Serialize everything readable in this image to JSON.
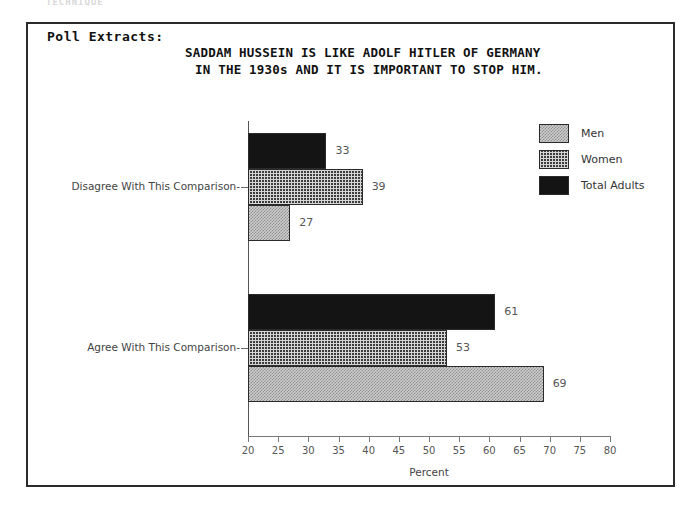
{
  "artifact_text": "TECHNIQUE",
  "header": {
    "poll_label": "Poll Extracts:"
  },
  "chart_data": {
    "type": "bar",
    "orientation": "horizontal",
    "title_line1": "SADDAM HUSSEIN IS LIKE ADOLF HITLER OF GERMANY",
    "title_line2": "IN THE 1930s AND IT IS IMPORTANT TO STOP HIM.",
    "xlabel": "Percent",
    "ylabel": "",
    "xlim": [
      20,
      80
    ],
    "xticks": [
      20,
      25,
      30,
      35,
      40,
      45,
      50,
      55,
      60,
      65,
      70,
      75,
      80
    ],
    "xticklabels": [
      "20",
      "25",
      "30",
      "35",
      "40",
      "45",
      "50",
      "55",
      "60",
      "65",
      "70",
      "75",
      "80"
    ],
    "grid": false,
    "legend_position": "top-right",
    "categories": [
      "Disagree With This Comparison",
      "Agree With This Comparison"
    ],
    "series": [
      {
        "name": "Men",
        "values": [
          27,
          69
        ],
        "pattern": "light-checker",
        "color": "#cfcfcf"
      },
      {
        "name": "Women",
        "values": [
          39,
          53
        ],
        "pattern": "dark-crosshatch",
        "color": "#3c3c3c"
      },
      {
        "name": "Total Adults",
        "values": [
          33,
          61
        ],
        "pattern": "solid-black",
        "color": "#141414"
      }
    ],
    "bars": [
      {
        "group": "Disagree With This Comparison",
        "series": "Total Adults",
        "value": 33,
        "label": "33"
      },
      {
        "group": "Disagree With This Comparison",
        "series": "Women",
        "value": 39,
        "label": "39"
      },
      {
        "group": "Disagree With This Comparison",
        "series": "Men",
        "value": 27,
        "label": "27"
      },
      {
        "group": "Agree With This Comparison",
        "series": "Total Adults",
        "value": 61,
        "label": "61"
      },
      {
        "group": "Agree With This Comparison",
        "series": "Women",
        "value": 53,
        "label": "53"
      },
      {
        "group": "Agree With This Comparison",
        "series": "Men",
        "value": 69,
        "label": "69"
      }
    ]
  },
  "legend": {
    "items": [
      {
        "label": "Men"
      },
      {
        "label": "Women"
      },
      {
        "label": "Total Adults"
      }
    ]
  }
}
